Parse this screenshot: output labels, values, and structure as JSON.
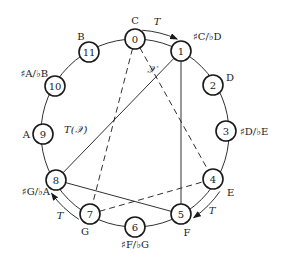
{
  "diagram": {
    "center": [
      135,
      133
    ],
    "radius": 94,
    "node_radius": 10,
    "colors": {
      "stroke": "#1a1a1a",
      "background": "#ffffff"
    },
    "nodes": [
      {
        "pc": "0",
        "note": "C",
        "x": 135,
        "y": 39,
        "lx": 135,
        "ly": 24,
        "anchor": "middle"
      },
      {
        "pc": "1",
        "note": "♯C/♭D",
        "x": 181,
        "y": 51,
        "lx": 193,
        "ly": 40,
        "anchor": "start"
      },
      {
        "pc": "2",
        "note": "D",
        "x": 213,
        "y": 85,
        "lx": 226,
        "ly": 81,
        "anchor": "start"
      },
      {
        "pc": "3",
        "note": "♯D/♭E",
        "x": 226,
        "y": 131,
        "lx": 240,
        "ly": 135,
        "anchor": "start"
      },
      {
        "pc": "4",
        "note": "E",
        "x": 213,
        "y": 179,
        "lx": 227,
        "ly": 196,
        "anchor": "start"
      },
      {
        "pc": "5",
        "note": "F",
        "x": 181,
        "y": 214,
        "lx": 187,
        "ly": 236,
        "anchor": "middle"
      },
      {
        "pc": "6",
        "note": "♯F/♭G",
        "x": 135,
        "y": 227,
        "lx": 135,
        "ly": 248,
        "anchor": "middle"
      },
      {
        "pc": "7",
        "note": "G",
        "x": 90,
        "y": 214,
        "lx": 85,
        "ly": 235,
        "anchor": "middle"
      },
      {
        "pc": "8",
        "note": "♯G/♭A",
        "x": 56,
        "y": 180,
        "lx": 50,
        "ly": 195,
        "anchor": "end"
      },
      {
        "pc": "9",
        "note": "A",
        "x": 43,
        "y": 134,
        "lx": 30,
        "ly": 138,
        "anchor": "end"
      },
      {
        "pc": "10",
        "note": "♯A/♭B",
        "x": 55,
        "y": 86,
        "lx": 48,
        "ly": 77,
        "anchor": "end"
      },
      {
        "pc": "11",
        "note": "B",
        "x": 89,
        "y": 52,
        "lx": 81,
        "ly": 40,
        "anchor": "middle"
      }
    ],
    "edges": [
      {
        "from": 1,
        "to": 8,
        "style": "solid",
        "group": "T(𝒳)"
      },
      {
        "from": 1,
        "to": 5,
        "style": "solid",
        "group": "T(𝒳)"
      },
      {
        "from": 8,
        "to": 5,
        "style": "solid",
        "group": "T(𝒳)"
      },
      {
        "from": 0,
        "to": 7,
        "style": "dashed",
        "group": "𝒳"
      },
      {
        "from": 0,
        "to": 4,
        "style": "dashed",
        "group": "𝒳"
      },
      {
        "from": 7,
        "to": 4,
        "style": "dashed",
        "group": "𝒳"
      }
    ],
    "labels": {
      "set_x": "𝒳",
      "set_tx": "T(𝒳)",
      "transposition": "T"
    },
    "label_positions": {
      "set_x": [
        147,
        73
      ],
      "set_tx": [
        64,
        133
      ]
    },
    "arrows": [
      {
        "from": 0,
        "to": 1,
        "label": "T",
        "lx": 157,
        "ly": 25
      },
      {
        "from": 4,
        "to": 5,
        "label": "T",
        "lx": 212,
        "ly": 214
      },
      {
        "from": 7,
        "to": 8,
        "label": "T",
        "lx": 60,
        "ly": 219
      }
    ]
  }
}
